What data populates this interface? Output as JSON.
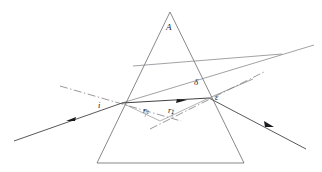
{
  "figure": {
    "caption_strip": "",
    "background_color": "#ffffff",
    "line_color": "#555558",
    "ray_color": "#2b2b2e",
    "label_color": "#1d1d1d"
  },
  "labels": {
    "apex_angle": "A",
    "incidence_angle": "i",
    "refraction_angle_1": "r",
    "refraction_angle_1_sub": "1",
    "refraction_angle_2": "r",
    "refraction_angle_2_sub": "2",
    "deviation_angle": "δ",
    "emergence_angle": "ε"
  },
  "geometry": {
    "prism": {
      "apex": [
        170,
        12
      ],
      "bottom_left": [
        97,
        163
      ],
      "bottom_right": [
        244,
        163
      ]
    },
    "entry_point": [
      122,
      103
    ],
    "exit_point": [
      209,
      98
    ],
    "incident_ray_start": [
      14,
      138
    ],
    "emergent_ray_end": [
      305,
      148
    ],
    "incident_extension_end": [
      313,
      47
    ],
    "normal_entry_start": [
      66,
      88
    ],
    "normal_entry_end": [
      178,
      120
    ],
    "normal_exit_start": [
      152,
      127
    ],
    "normal_exit_end": [
      262,
      73
    ],
    "deviation_line_start": [
      133,
      66
    ],
    "deviation_line_end": [
      281,
      55
    ]
  },
  "arrows": [
    {
      "name": "incident-ray-arrow",
      "x": 69,
      "y": 120
    },
    {
      "name": "internal-ray-arrow",
      "x": 180,
      "y": 101
    },
    {
      "name": "emergent-ray-arrow",
      "x": 268,
      "y": 124
    }
  ]
}
